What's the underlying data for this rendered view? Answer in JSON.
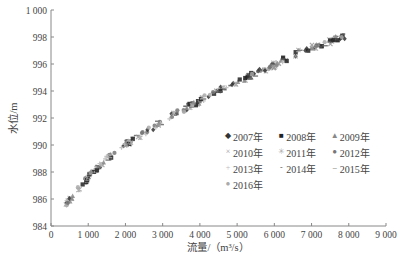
{
  "chart_data": {
    "type": "scatter",
    "title": "",
    "xlabel": "流量/（m³/s）",
    "ylabel": "水位/m",
    "xlim": [
      0,
      9000
    ],
    "ylim": [
      984,
      1000
    ],
    "x_ticks": [
      "0",
      "1 000",
      "2 000",
      "3 000",
      "4 000",
      "5 000",
      "6 000",
      "7 000",
      "8 000",
      "9 000"
    ],
    "y_ticks": [
      "984",
      "986",
      "988",
      "990",
      "992",
      "994",
      "996",
      "998",
      "1 000"
    ],
    "grid": false,
    "legend_position": "inside-lower-right",
    "trend_points": [
      {
        "x": 400,
        "y": 985.6
      },
      {
        "x": 700,
        "y": 986.6
      },
      {
        "x": 1050,
        "y": 987.8
      },
      {
        "x": 1500,
        "y": 989.0
      },
      {
        "x": 1960,
        "y": 990.0
      },
      {
        "x": 2600,
        "y": 991.1
      },
      {
        "x": 3200,
        "y": 992.1
      },
      {
        "x": 3800,
        "y": 993.0
      },
      {
        "x": 4400,
        "y": 993.9
      },
      {
        "x": 5000,
        "y": 994.7
      },
      {
        "x": 5600,
        "y": 995.4
      },
      {
        "x": 6200,
        "y": 996.2
      },
      {
        "x": 6700,
        "y": 996.9
      },
      {
        "x": 7300,
        "y": 997.5
      },
      {
        "x": 7900,
        "y": 998.1
      }
    ],
    "series": [
      {
        "name": "2007年",
        "marker": "diamond",
        "color": "#333333"
      },
      {
        "name": "2008年",
        "marker": "square",
        "color": "#222222"
      },
      {
        "name": "2009年",
        "marker": "triangle",
        "color": "#888888"
      },
      {
        "name": "2010年",
        "marker": "x",
        "color": "#999999"
      },
      {
        "name": "2011年",
        "marker": "star",
        "color": "#aaaaaa"
      },
      {
        "name": "2012年",
        "marker": "circle",
        "color": "#777777"
      },
      {
        "name": "2013年",
        "marker": "plus",
        "color": "#bbbbbb"
      },
      {
        "name": "2014年",
        "marker": "dash",
        "color": "#555555"
      },
      {
        "name": "2015年",
        "marker": "long-dash",
        "color": "#666666"
      },
      {
        "name": "2016年",
        "marker": "circle",
        "color": "#aaaaaa"
      }
    ]
  },
  "legend": {
    "rows": [
      [
        {
          "label": "2007年",
          "glyph": "◆"
        },
        {
          "label": "2008年",
          "glyph": "■"
        },
        {
          "label": "2009年",
          "glyph": "▲"
        }
      ],
      [
        {
          "label": "2010年",
          "glyph": "×"
        },
        {
          "label": "2011年",
          "glyph": "✳"
        },
        {
          "label": "2012年",
          "glyph": "●"
        }
      ],
      [
        {
          "label": "2013年",
          "glyph": "+"
        },
        {
          "label": "2014年",
          "glyph": "-"
        },
        {
          "label": "2015年",
          "glyph": "–"
        }
      ],
      [
        {
          "label": "2016年",
          "glyph": "●"
        }
      ]
    ]
  }
}
